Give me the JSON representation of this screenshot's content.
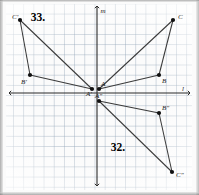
{
  "figure": {
    "kind": "coordinate-plane-reflections",
    "background_color": "#fbfbfb",
    "grid_color": "#96a8ba",
    "axis_color": "#2b2b2b",
    "point_color": "#111111",
    "segment_color": "#3a3a3a"
  },
  "axes": {
    "vertical_label": "m",
    "horizontal_label": "l",
    "origin_px": {
      "x": 97,
      "y": 93
    },
    "grid_spacing_px": 10.2
  },
  "problem_labels": [
    {
      "text": "33.",
      "x": 38,
      "y": 17
    },
    {
      "text": "32.",
      "x": 118,
      "y": 147
    }
  ],
  "chart_data": {
    "type": "scatter",
    "title": "",
    "xlabel": "l",
    "ylabel": "m",
    "grid": true,
    "legend": "none",
    "series": [
      {
        "name": "Triangle ABC",
        "closed": true,
        "points": [
          {
            "label": "A",
            "x": 99,
            "y": 89,
            "label_dx": 2,
            "label_dy": -3
          },
          {
            "label": "B",
            "x": 159,
            "y": 75,
            "label_dx": 3,
            "label_dy": 8
          },
          {
            "label": "C",
            "x": 173,
            "y": 20,
            "label_dx": 5,
            "label_dy": -1
          }
        ]
      },
      {
        "name": "Triangle A'B'C' (reflection over m)",
        "closed": true,
        "points": [
          {
            "label": "A'",
            "x": 92,
            "y": 89,
            "label_dx": -6,
            "label_dy": 7
          },
          {
            "label": "B'",
            "x": 30,
            "y": 75,
            "label_dx": -9,
            "label_dy": 9
          },
          {
            "label": "C'",
            "x": 20,
            "y": 20,
            "label_dx": -8,
            "label_dy": -1
          }
        ]
      },
      {
        "name": "Triangle A''B''C'' (reflection over l)",
        "closed": true,
        "points": [
          {
            "label": "A″",
            "x": 99,
            "y": 101,
            "label_dx": -4,
            "label_dy": -3
          },
          {
            "label": "B″",
            "x": 159,
            "y": 113,
            "label_dx": 3,
            "label_dy": -3
          },
          {
            "label": "C″",
            "x": 172,
            "y": 172,
            "label_dx": 4,
            "label_dy": 5
          }
        ]
      }
    ]
  }
}
